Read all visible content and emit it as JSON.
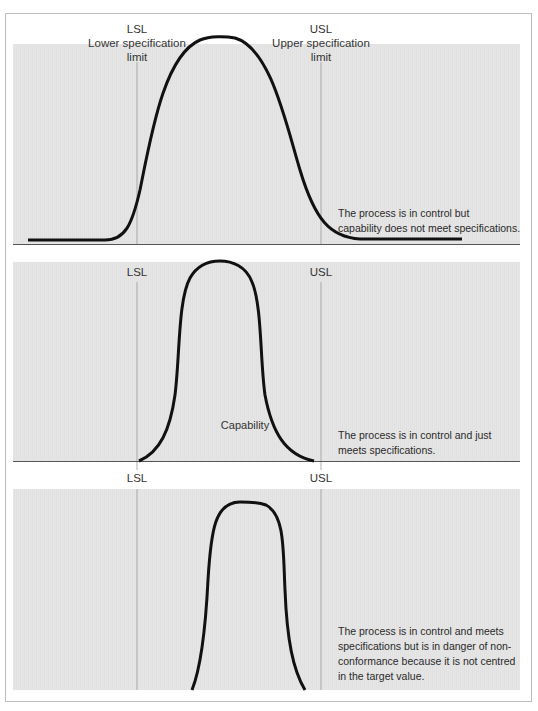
{
  "panels": [
    {
      "lsl_label": "LSL",
      "lsl_desc_line1": "Lower specification",
      "lsl_desc_line2": "limit",
      "usl_label": "USL",
      "usl_desc_line1": "Upper specification",
      "usl_desc_line2": "limit",
      "note_lines": [
        "The process is in control but",
        "capability does not meet specifications."
      ]
    },
    {
      "lsl_label": "LSL",
      "usl_label": "USL",
      "curve_label": "Capability",
      "note_lines": [
        "The process is in control and just",
        "meets specifications."
      ]
    },
    {
      "lsl_label": "LSL",
      "usl_label": "USL",
      "note_lines": [
        "The process is in control and meets",
        "specifications but is in danger of non-",
        "conformance because it is not centred",
        "in the target value."
      ]
    }
  ],
  "colors": {
    "panel_background": "#e3e3e3",
    "curve": "#111111",
    "spec_line": "#9a9a9a",
    "baseline": "#555555",
    "frame_border": "#bdbdbd"
  }
}
